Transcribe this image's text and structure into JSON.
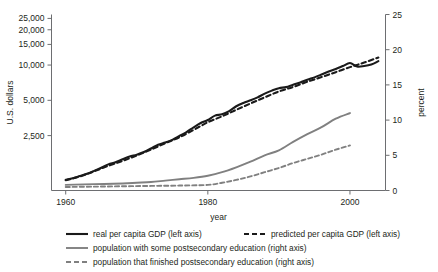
{
  "chart_data": {
    "type": "line",
    "title": "",
    "xlabel": "year",
    "ylabel": "U.S. dollars",
    "y2label": "percent",
    "xlim": [
      1958,
      2005
    ],
    "xticks": [
      1960,
      1980,
      2000
    ],
    "xtick_labels": [
      "1960",
      "1980",
      "2000"
    ],
    "yscale": "log",
    "ylim": [
      850,
      27000
    ],
    "yticks": [
      2500,
      5000,
      10000,
      15000,
      20000,
      25000
    ],
    "ytick_labels": [
      "2,500",
      "5,000",
      "10,000",
      "15,000",
      "20,000",
      "25,000"
    ],
    "y2lim": [
      0,
      25
    ],
    "y2ticks": [
      0,
      5,
      10,
      15,
      20,
      25
    ],
    "y2tick_labels": [
      "0",
      "5",
      "10",
      "15",
      "20",
      "25"
    ],
    "grid": false,
    "legend_position": "below",
    "series": [
      {
        "name": "real per capita GDP (left axis)",
        "axis": "left",
        "color": "#1a1a1a",
        "style": "solid",
        "width": 2.1,
        "x": [
          1960,
          1961,
          1962,
          1963,
          1964,
          1965,
          1966,
          1967,
          1968,
          1969,
          1970,
          1971,
          1972,
          1973,
          1974,
          1975,
          1976,
          1977,
          1978,
          1979,
          1980,
          1981,
          1982,
          1983,
          1984,
          1985,
          1986,
          1987,
          1988,
          1989,
          1990,
          1991,
          1992,
          1993,
          1994,
          1995,
          1996,
          1997,
          1998,
          1999,
          2000,
          2001,
          2002,
          2003,
          2004
        ],
        "y": [
          1050,
          1080,
          1130,
          1180,
          1250,
          1330,
          1420,
          1480,
          1570,
          1660,
          1720,
          1810,
          1940,
          2090,
          2180,
          2300,
          2480,
          2680,
          2940,
          3200,
          3400,
          3700,
          3800,
          4050,
          4450,
          4750,
          5000,
          5300,
          5700,
          6050,
          6350,
          6480,
          6800,
          7100,
          7500,
          7850,
          8300,
          8800,
          9250,
          9800,
          10400,
          9700,
          9800,
          10100,
          10800
        ]
      },
      {
        "name": "predicted per capita GDP (left axis)",
        "axis": "left",
        "color": "#1a1a1a",
        "style": "dashed",
        "width": 2.1,
        "x": [
          1960,
          1962,
          1964,
          1966,
          1968,
          1970,
          1972,
          1974,
          1976,
          1978,
          1980,
          1982,
          1984,
          1986,
          1988,
          1990,
          1992,
          1994,
          1996,
          1998,
          2000,
          2002,
          2004
        ],
        "y": [
          1040,
          1120,
          1240,
          1380,
          1520,
          1690,
          1900,
          2150,
          2420,
          2800,
          3250,
          3650,
          4150,
          4700,
          5300,
          5950,
          6500,
          7200,
          7900,
          8700,
          9600,
          10500,
          11600
        ]
      },
      {
        "name": "population with some postsecondary education (right axis)",
        "axis": "right",
        "color": "#808080",
        "style": "solid",
        "width": 1.9,
        "x": [
          1960,
          1964,
          1968,
          1970,
          1972,
          1974,
          1976,
          1978,
          1980,
          1982,
          1984,
          1986,
          1988,
          1990,
          1992,
          1994,
          1996,
          1998,
          2000
        ],
        "y": [
          0.8,
          0.9,
          1.0,
          1.1,
          1.2,
          1.4,
          1.6,
          1.8,
          2.1,
          2.6,
          3.3,
          4.1,
          5.0,
          5.7,
          6.9,
          8.0,
          9.0,
          10.2,
          11.0
        ]
      },
      {
        "name": "population that finished postsecondary education (right axis)",
        "axis": "right",
        "color": "#808080",
        "style": "dashed",
        "width": 1.9,
        "x": [
          1960,
          1964,
          1968,
          1972,
          1976,
          1980,
          1982,
          1984,
          1986,
          1988,
          1990,
          1992,
          1994,
          1996,
          1998,
          2000
        ],
        "y": [
          0.5,
          0.55,
          0.6,
          0.65,
          0.7,
          0.8,
          1.1,
          1.5,
          2.0,
          2.6,
          3.2,
          3.9,
          4.5,
          5.1,
          5.8,
          6.4
        ]
      }
    ]
  },
  "legend": {
    "items": [
      {
        "label": "real per capita GDP (left axis)",
        "color": "#1a1a1a",
        "style": "solid"
      },
      {
        "label": "predicted per capita GDP (left axis)",
        "color": "#1a1a1a",
        "style": "dashed"
      },
      {
        "label": "population with some postsecondary education (right axis)",
        "color": "#808080",
        "style": "solid"
      },
      {
        "label": "population that finished postsecondary education (right axis)",
        "color": "#808080",
        "style": "dashed"
      }
    ]
  }
}
